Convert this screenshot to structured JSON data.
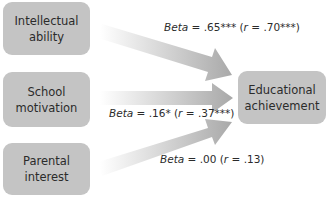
{
  "diagram": {
    "predictors": [
      {
        "line1": "Intellectual",
        "line2": "ability"
      },
      {
        "line1": "School",
        "line2": "motivation"
      },
      {
        "line1": "Parental",
        "line2": "interest"
      }
    ],
    "outcome": {
      "line1": "Educational",
      "line2": "achievement"
    },
    "paths": [
      {
        "beta_label": "Beta",
        "beta_value": " = .65*** (",
        "r_label": "r",
        "r_value": " = .70***)"
      },
      {
        "beta_label": "Beta",
        "beta_value": " = .16* (",
        "r_label": "r",
        "r_value": " = .37***)"
      },
      {
        "beta_label": "Beta",
        "beta_value": " = .00 (",
        "r_label": "r",
        "r_value": " = .13)"
      }
    ],
    "colors": {
      "box": "#c4c4c4",
      "arrow_end": "#a9a9a9",
      "arrow_start": "#ffffff",
      "text": "#2b2b2b"
    }
  }
}
